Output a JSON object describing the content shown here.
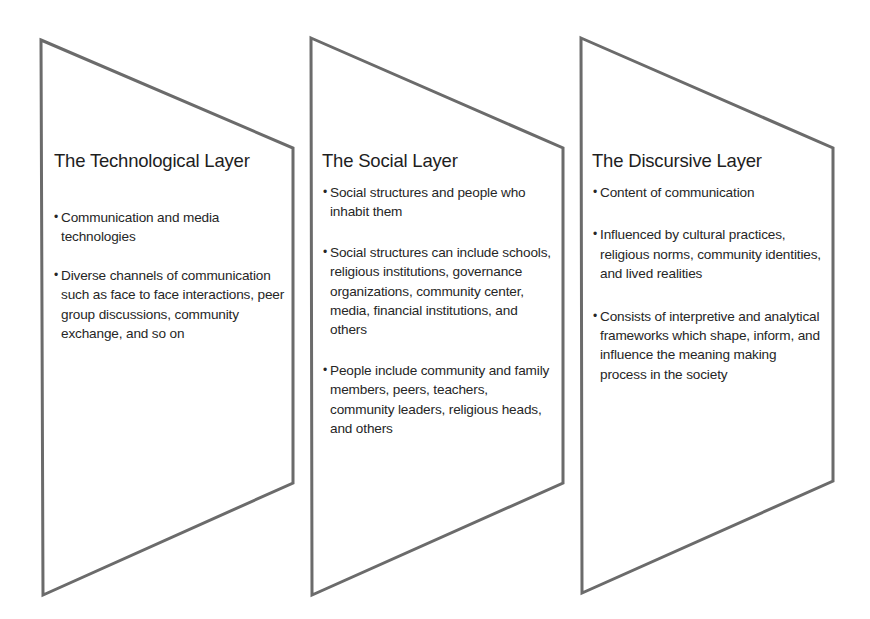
{
  "diagram": {
    "stroke_color": "#6b6b6b",
    "fill_color": "#ffffff",
    "shape": "trapezoid panel (slanted top and bottom edges)",
    "layers": [
      {
        "title": "The Technological Layer",
        "bullets": [
          "Communication and media technologies",
          "Diverse channels of communication such as face to face interactions, peer group discussions, community exchange, and so on"
        ]
      },
      {
        "title": "The Social Layer",
        "bullets": [
          "Social structures and people who inhabit them",
          "Social structures can include schools, religious institutions, governance organizations, community center, media, financial institutions, and others",
          "People include community and family members, peers, teachers, community leaders, religious heads, and others"
        ]
      },
      {
        "title": "The Discursive Layer",
        "bullets": [
          "Content of communication",
          "Influenced by cultural practices, religious norms, community identities, and lived realities",
          "Consists of interpretive and analytical frameworks which shape, inform, and influence the meaning making process in the society"
        ]
      }
    ],
    "bullet_glyph": "•"
  }
}
